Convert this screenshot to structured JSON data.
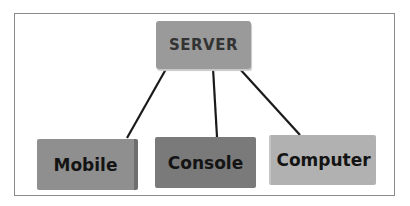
{
  "diagram": {
    "type": "hub-and-spoke",
    "root": {
      "label": "SERVER",
      "color": "#9a9a9a"
    },
    "children": [
      {
        "label": "Mobile",
        "color": "#8f8f8f"
      },
      {
        "label": "Console",
        "color": "#7a7a7a"
      },
      {
        "label": "Computer",
        "color": "#b1b1b1"
      }
    ],
    "edges": [
      {
        "from": "SERVER",
        "to": "Mobile"
      },
      {
        "from": "SERVER",
        "to": "Console"
      },
      {
        "from": "SERVER",
        "to": "Computer"
      }
    ],
    "line_color": "#1a1a1a"
  }
}
